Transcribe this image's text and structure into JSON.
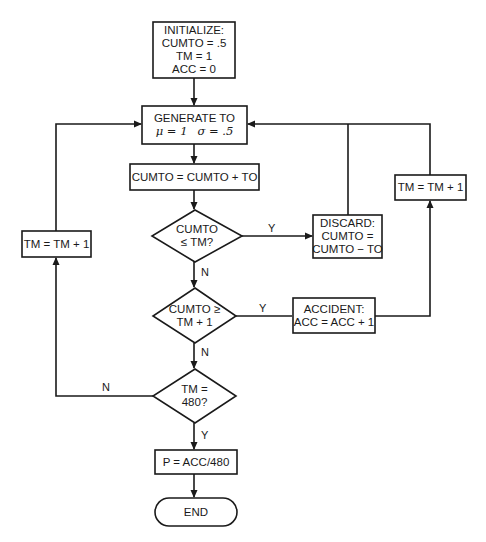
{
  "flowchart": {
    "init": {
      "lines": [
        "INITIALIZE:",
        "CUMTO = .5",
        "TM = 1",
        "ACC = 0"
      ]
    },
    "generate": {
      "line1": "GENERATE TO",
      "mu": "μ = 1",
      "sigma": "σ = .5"
    },
    "accumulate": {
      "text": "CUMTO = CUMTO + TO"
    },
    "decision1": {
      "lines": [
        "CUMTO",
        "≤ TM?"
      ],
      "yes_label": "Y",
      "no_label": "N"
    },
    "discard": {
      "lines": [
        "DISCARD:",
        "CUMTO =",
        "CUMTO − TO"
      ]
    },
    "decision2": {
      "lines": [
        "CUMTO ≥",
        "TM + 1"
      ],
      "yes_label": "Y",
      "no_label": "N"
    },
    "accident": {
      "lines": [
        "ACCIDENT:",
        "ACC = ACC + 1"
      ]
    },
    "increment_right": {
      "text": "TM = TM + 1"
    },
    "increment_left": {
      "text": "TM = TM + 1"
    },
    "decision3": {
      "lines": [
        "TM =",
        "480?"
      ],
      "yes_label": "Y",
      "no_label": "N"
    },
    "result": {
      "text": "P = ACC/480"
    },
    "end": {
      "text": "END"
    }
  },
  "colors": {
    "line": "#1a1a1a",
    "background": "#ffffff"
  }
}
